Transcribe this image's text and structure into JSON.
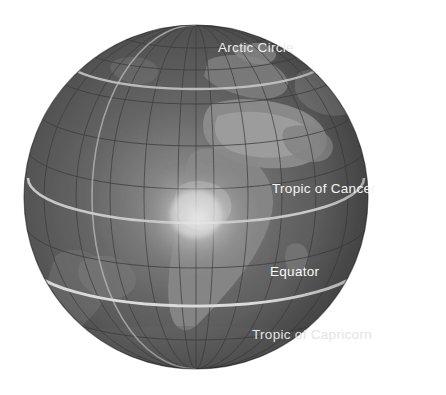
{
  "scene": {
    "title": "Earth globe with latitude reference circles",
    "background_color": "#ffffff",
    "width": 446,
    "height": 395
  },
  "globe": {
    "name": "earth-globe",
    "center_x": 196,
    "center_y": 197,
    "radius": 172,
    "ocean_color": "#4a4a4a",
    "land_color": "#8c8c8c",
    "highlight_color": "#e8e8e8",
    "shadow_color": "#1e1e1e",
    "graticule_color": "#303030",
    "graticule_spacing_degrees": 15,
    "visible_continents": [
      "Africa",
      "Europe",
      "South America",
      "Asia"
    ]
  },
  "latitude_lines": [
    {
      "id": "arctic-circle",
      "label": "Arctic Circle",
      "latitude_degrees": 66.5,
      "line_color": "#d8d8d8",
      "label_color": "#ededed"
    },
    {
      "id": "tropic-of-cancer",
      "label": "Tropic of Cancer",
      "latitude_degrees": 23.5,
      "line_color": "#e0e0e0",
      "label_color": "#f5f5f5"
    },
    {
      "id": "equator",
      "label": "Equator",
      "latitude_degrees": 0,
      "line_color": "#f0f0f0",
      "label_color": "#fafafa"
    },
    {
      "id": "tropic-of-capricorn",
      "label": "Tropic of Capricorn",
      "latitude_degrees": -23.5,
      "line_color": "#cfcfcf",
      "label_color": "#e4e4e4"
    }
  ],
  "meridian": {
    "id": "prime-meridian",
    "label": "Prime Meridian",
    "longitude_degrees": 0,
    "line_color": "#cccccc"
  }
}
